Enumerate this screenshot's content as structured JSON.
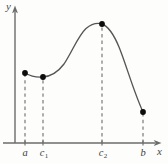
{
  "figure": {
    "name": "function-graph-critical-points",
    "background_color": "#fdfdfc",
    "axis_color": "#6b6b6b",
    "curve_color": "#555555",
    "dash_color": "#7a7a7a",
    "point_color": "#0d0d0d"
  },
  "axes": {
    "y_label": "y",
    "x_label": "x",
    "origin": {
      "x": 15,
      "y": 143
    },
    "x_axis_end": 160,
    "y_axis_top": 8
  },
  "ticks": [
    {
      "id": "a",
      "label": "a",
      "sub": "",
      "x": 25
    },
    {
      "id": "c1",
      "label": "c",
      "sub": "1",
      "x": 43
    },
    {
      "id": "c2",
      "label": "c",
      "sub": "2",
      "x": 102
    },
    {
      "id": "b",
      "label": "b",
      "sub": "",
      "x": 143
    }
  ],
  "chart_data": {
    "type": "line",
    "title": "",
    "xlabel": "x",
    "ylabel": "y",
    "grid": false,
    "legend": null,
    "x": [
      "a",
      "c1",
      "c2",
      "b"
    ],
    "marked_points": [
      {
        "label": "a",
        "px_x": 25,
        "px_y": 73,
        "role": "left-endpoint"
      },
      {
        "label": "c1",
        "px_x": 43,
        "px_y": 77,
        "role": "local-minimum"
      },
      {
        "label": "c2",
        "px_x": 102,
        "px_y": 24,
        "role": "local-maximum"
      },
      {
        "label": "b",
        "px_x": 143,
        "px_y": 112,
        "role": "right-endpoint"
      }
    ],
    "curve_path": "M 25,73 C 31,76.5 37.5,77.5 43,77 C 52,76.2 58,72 64,64 C 72,52 78,36 86,28.5 C 92,23.5 97,22.5 102,24 C 109,26.5 114,35 119,47 C 126,64 133,90 143,112",
    "axis_ranges": {
      "xlim": [
        "a",
        "b"
      ],
      "ylim": [
        0,
        null
      ]
    }
  }
}
